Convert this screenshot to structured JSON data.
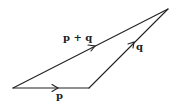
{
  "diagram": {
    "type": "vector-addition-triangle",
    "vertices": {
      "origin": [
        13,
        88
      ],
      "p_end": [
        89,
        88
      ],
      "sum_end": [
        168,
        9
      ]
    },
    "vectors": [
      {
        "id": "p",
        "label": "p",
        "from": "origin",
        "to": "p_end"
      },
      {
        "id": "q",
        "label": "q",
        "from": "p_end",
        "to": "sum_end"
      },
      {
        "id": "p_plus_q",
        "label": "p + q",
        "from": "origin",
        "to": "sum_end"
      }
    ],
    "labels": {
      "p": "p",
      "q": "q",
      "p_plus_q": "p + q"
    },
    "colors": {
      "stroke": "#222222",
      "background": "#ffffff"
    }
  }
}
